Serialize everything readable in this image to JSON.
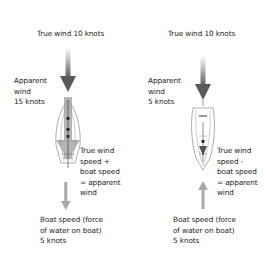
{
  "left": {
    "true_wind": "True wind 10 knots",
    "apparent_wind": [
      "Apparent",
      "wind",
      "15 knots"
    ],
    "equation": [
      "True wind",
      "speed +",
      "boat speed",
      "= apparent",
      "wind"
    ],
    "boat_speed": [
      "Boat speed (force",
      "of water on boat)",
      "5 knots"
    ]
  },
  "right": {
    "true_wind": "True wind 10 knots",
    "apparent_wind": [
      "Apparent",
      "wind",
      "5 knots"
    ],
    "equation": [
      "True wind",
      "speed -",
      "boat speed",
      "= apparent",
      "wind"
    ],
    "boat_speed": [
      "Boat speed (force",
      "of water on boat)",
      "5 knots"
    ]
  },
  "colors": {
    "wind_arrow_dark": "#555555",
    "apparent_bar": "#b0b0b0",
    "boat_arrow": "#a8a8a8",
    "hull_outline": "#8a8a8a"
  }
}
